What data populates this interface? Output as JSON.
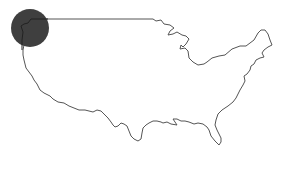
{
  "map": {
    "subject": "United States outline",
    "highlight": {
      "region": "Pacific Northwest",
      "marker": "circle",
      "color": "#3f3f3f"
    },
    "outline_color": "#555555",
    "background": "#ffffff"
  }
}
